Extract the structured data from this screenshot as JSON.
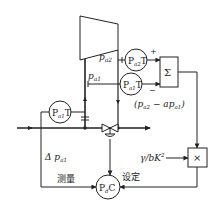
{
  "diagram": {
    "type": "process-control-diagram",
    "nodes": {
      "compressor": {
        "label": ""
      },
      "pa2_transmitter": {
        "label_main": "P",
        "label_sub": "a2",
        "label_suffix": "T"
      },
      "pa1_transmitter_right": {
        "label_main": "P",
        "label_sub": "a1",
        "label_suffix": "T"
      },
      "pa1_transmitter_left": {
        "label_main": "P",
        "label_sub": "a1",
        "label_suffix": "T"
      },
      "summer": {
        "label": "Σ"
      },
      "multiplier": {
        "label": "×"
      },
      "controller": {
        "label_main": "P",
        "label_sub": "d",
        "label_suffix": "C"
      }
    },
    "labels": {
      "p_a2": {
        "main": "p",
        "sub": "a2"
      },
      "p_a1": {
        "main": "p",
        "sub": "a1"
      },
      "plus_sign": "+",
      "minus_sign": "−",
      "difference_expr": "(pₐ₂ − apₐ₁)",
      "difference_open": "(",
      "difference_p1": "p",
      "difference_sub1": "a2",
      "difference_mid": " − ap",
      "difference_sub2": "a1",
      "difference_close": ")",
      "gain": "γ/bK",
      "gain_exp": "2",
      "delta_p": "Δ p",
      "delta_p_sub": "a1",
      "measure": "测量",
      "setpoint": "设定"
    },
    "colors": {
      "line": "#222222",
      "background": "#ffffff"
    }
  }
}
